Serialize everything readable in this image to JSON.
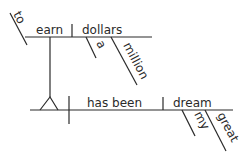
{
  "diagram": {
    "type": "sentence-diagram",
    "top_clause": {
      "preposition_marker": "to",
      "verb": "earn",
      "object": "dollars",
      "object_modifiers": [
        "a",
        "million"
      ]
    },
    "main_clause": {
      "subject_placeholder": "infinitive phrase on stilts",
      "verb": "has been",
      "complement": "dream",
      "complement_modifiers": [
        "my",
        "great"
      ]
    }
  },
  "labels": {
    "to": "to",
    "earn": "earn",
    "dollars": "dollars",
    "a": "a",
    "million": "million",
    "has_been": "has been",
    "dream": "dream",
    "my": "my",
    "great": "great"
  },
  "colors": {
    "ink": "#2a2a2a",
    "background": "#ffffff"
  }
}
